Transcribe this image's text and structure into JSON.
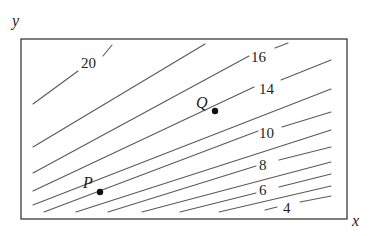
{
  "figure": {
    "type": "contour-map",
    "axes": {
      "x_label": "x",
      "y_label": "y"
    },
    "contour_labels": [
      "20",
      "16",
      "14",
      "10",
      "8",
      "6",
      "4"
    ],
    "points": [
      {
        "name": "P",
        "label": "P"
      },
      {
        "name": "Q",
        "label": "Q"
      }
    ],
    "colors": {
      "line": "#5a5a5a",
      "frame": "#3a3a3a",
      "text": "#1e1e1e",
      "background": "#ffffff"
    }
  }
}
